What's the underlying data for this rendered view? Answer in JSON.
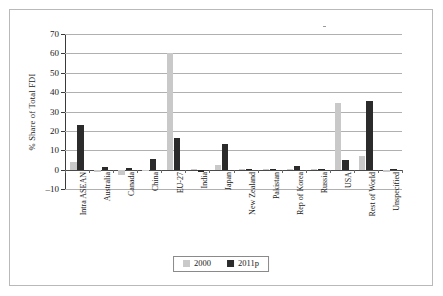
{
  "chart_data": {
    "type": "bar",
    "title": "",
    "xlabel": "",
    "ylabel": "% Share of Total FDI",
    "ylim": [
      -10,
      70
    ],
    "ytick_step": 10,
    "yticks": [
      "70",
      "60",
      "50",
      "40",
      "30",
      "20",
      "10",
      "0",
      "-10"
    ],
    "grid": true,
    "legend_position": "bottom-center",
    "categories": [
      "Intra ASEAN",
      "Australia",
      "Canada",
      "China",
      "EU-27",
      "India",
      "Japan",
      "New Zealand",
      "Pakistan",
      "Rep of Korea",
      "Russia",
      "USA",
      "Rest of World",
      "Unspecified"
    ],
    "series": [
      {
        "name": "2000",
        "color": "#c9c9c9",
        "values": [
          3.7,
          -1.0,
          -2.8,
          -0.3,
          60.0,
          0.2,
          2.4,
          0.1,
          0.0,
          0.1,
          0.0,
          34.5,
          6.8,
          -1.2
        ]
      },
      {
        "name": "2011p",
        "color": "#2b2b2b",
        "values": [
          22.9,
          1.1,
          0.7,
          5.3,
          16.1,
          -1.1,
          13.2,
          0.1,
          0.0,
          2.0,
          0.1,
          5.2,
          35.6,
          0.1
        ]
      }
    ]
  },
  "legend": {
    "items": [
      {
        "label": "2000"
      },
      {
        "label": "2011p"
      }
    ]
  }
}
